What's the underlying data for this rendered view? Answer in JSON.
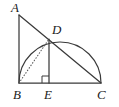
{
  "figure": {
    "canvas": {
      "width": 119,
      "height": 107,
      "background": "#ffffff"
    },
    "stroke_color": "#3a3a3a",
    "label_color": "#1b1b1b",
    "points": {
      "A": {
        "label": "A",
        "x": 19,
        "y": 15,
        "label_x": 11,
        "label_y": 12
      },
      "B": {
        "label": "B",
        "x": 19,
        "y": 83,
        "label_x": 13,
        "label_y": 99
      },
      "C": {
        "label": "C",
        "x": 101,
        "y": 83,
        "label_x": 97,
        "label_y": 99
      },
      "D": {
        "label": "D",
        "x": 49,
        "y": 39,
        "label_x": 52,
        "label_y": 34
      },
      "E": {
        "label": "E",
        "x": 49,
        "y": 83,
        "label_x": 44,
        "label_y": 99
      }
    },
    "segments": [
      {
        "name": "segment-AB",
        "from": "A",
        "to": "B",
        "style": "solid"
      },
      {
        "name": "segment-BC",
        "from": "B",
        "to": "C",
        "style": "solid"
      },
      {
        "name": "segment-AC",
        "from": "A",
        "to": "C",
        "style": "solid"
      },
      {
        "name": "segment-DE",
        "from": "D",
        "to": "E",
        "style": "solid"
      },
      {
        "name": "segment-BD",
        "from": "B",
        "to": "D",
        "style": "dotted"
      }
    ],
    "arc": {
      "name": "semicircle-BC",
      "from": "B",
      "to": "C",
      "center_x": 60,
      "center_y": 83,
      "radius": 41,
      "description": "semicircle with diameter BC bulging upward through D"
    },
    "right_angle": {
      "name": "right-angle-at-E",
      "vertex": "E",
      "size": 7,
      "description": "square marker indicating DE perpendicular to BC"
    }
  }
}
